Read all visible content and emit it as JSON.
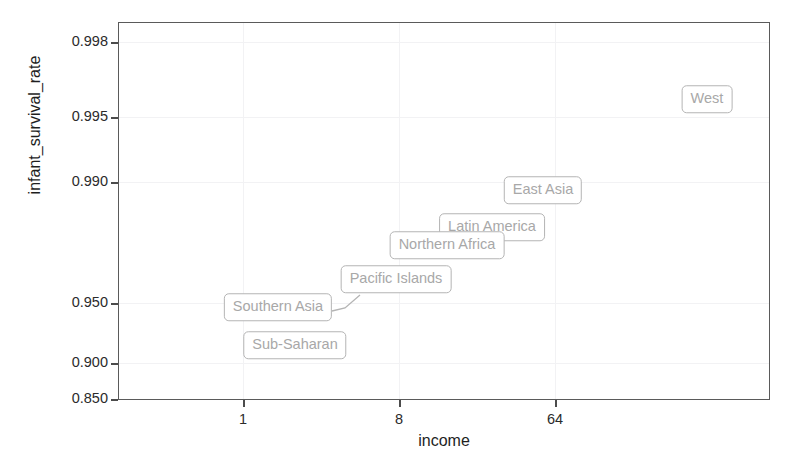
{
  "chart_data": {
    "type": "scatter",
    "title": "",
    "xlabel": "income",
    "ylabel": "infant_survival_rate",
    "xscale": "log2",
    "yscale": "logit",
    "grid": true,
    "legend": "none",
    "xticks": [
      {
        "label": "1",
        "value": 1,
        "px": 243
      },
      {
        "label": "8",
        "value": 8,
        "px": 399
      },
      {
        "label": "64",
        "value": 64,
        "px": 555
      }
    ],
    "yticks": [
      {
        "label": "0.998",
        "value": 0.998,
        "px": 42
      },
      {
        "label": "0.995",
        "value": 0.995,
        "px": 117
      },
      {
        "label": "0.990",
        "value": 0.99,
        "px": 182
      },
      {
        "label": "0.950",
        "value": 0.95,
        "px": 303
      },
      {
        "label": "0.900",
        "value": 0.9,
        "px": 363
      },
      {
        "label": "0.850",
        "value": 0.85,
        "px": 399
      }
    ],
    "xlim": [
      0.45,
      170
    ],
    "ylim": [
      0.85,
      0.9988
    ],
    "points": [
      {
        "name": "West",
        "income": 70.0,
        "infant_survival_rate": 0.996,
        "px": 707,
        "py": 99
      },
      {
        "name": "East Asia",
        "income": 13.5,
        "infant_survival_rate": 0.9888,
        "px": 543,
        "py": 190
      },
      {
        "name": "Latin America",
        "income": 9.5,
        "infant_survival_rate": 0.984,
        "px": 492,
        "py": 227
      },
      {
        "name": "Northern Africa",
        "income": 6.5,
        "infant_survival_rate": 0.9806,
        "px": 447,
        "py": 245
      },
      {
        "name": "Pacific Islands",
        "income": 3.1,
        "infant_survival_rate": 0.957,
        "px": 396,
        "py": 279
      },
      {
        "name": "Southern Asia",
        "income": 1.35,
        "infant_survival_rate": 0.949,
        "px": 278,
        "py": 307
      },
      {
        "name": "Sub-Saharan",
        "income": 1.6,
        "infant_survival_rate": 0.9085,
        "px": 295,
        "py": 345
      }
    ]
  },
  "style": {
    "label_text_color": "#a8a8a8",
    "label_border_color": "#b4b4b4",
    "axis_color": "#5a5a5a",
    "tick_text_color": "#2b2b2b",
    "grid_color": "#f2f2f4",
    "background": "#ffffff"
  }
}
